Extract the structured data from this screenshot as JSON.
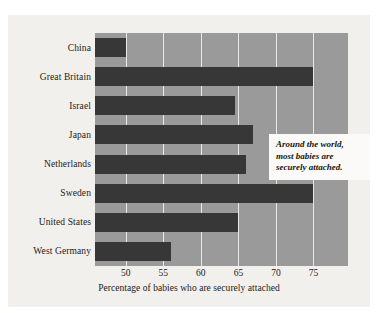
{
  "chart_data": {
    "type": "bar",
    "orientation": "horizontal",
    "title": "",
    "xlabel": "Percentage of babies who are securely attached",
    "ylabel": "",
    "categories": [
      "China",
      "Great Britain",
      "Israel",
      "Japan",
      "Netherlands",
      "Sweden",
      "United States",
      "West Germany"
    ],
    "values": [
      50,
      75,
      64.5,
      67,
      66,
      75,
      65,
      56
    ],
    "xlim": [
      45.9,
      79.6
    ],
    "xticks": [
      50,
      55,
      60,
      65,
      70,
      75
    ],
    "xtick_labels": [
      "50",
      "55",
      "60",
      "65",
      "70",
      "75"
    ],
    "grid": "vertical-only",
    "legend": "none",
    "annotations": [
      {
        "text": "Around the world, most babies are securely attached.",
        "line1": "Around the world,",
        "line2": "most babies are",
        "line3": "securely attached.",
        "style": "bold-italic-serif-white-box"
      }
    ],
    "colors": {
      "bar": "#373737",
      "panel": "#9a9a9a",
      "gridline": "#e8e8e6",
      "figure_background": "#f2f0ec",
      "page_background": "#ffffff",
      "callout_background": "#fbfaf8",
      "text": "#1c1a18"
    }
  }
}
